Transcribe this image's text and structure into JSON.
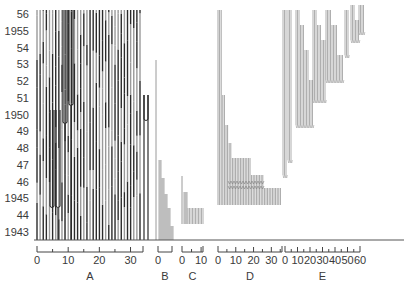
{
  "chart_data": {
    "type": "bar",
    "title": "",
    "xlabel": "",
    "ylabel": "",
    "y_axis": {
      "labels": [
        "56",
        "1955",
        "54",
        "53",
        "52",
        "51",
        "1950",
        "49",
        "48",
        "47",
        "46",
        "1945",
        "44",
        "1943"
      ],
      "years": [
        1956,
        1955,
        1954,
        1953,
        1952,
        1951,
        1950,
        1949,
        1948,
        1947,
        1946,
        1945,
        1944,
        1943
      ],
      "ylim": [
        1943,
        1956
      ]
    },
    "groups": [
      {
        "name": "A",
        "ticks": [
          "0",
          "10",
          "20",
          "30"
        ],
        "tick_values": [
          0,
          10,
          20,
          30
        ],
        "max": 34,
        "lines": 34,
        "start_year": 1943,
        "end_year": 1956
      },
      {
        "name": "B",
        "ticks": [
          "0"
        ],
        "tick_values": [
          0
        ],
        "max": 5,
        "lines": 5,
        "start_year": 1943,
        "end_year": 1947
      },
      {
        "name": "C",
        "ticks": [
          "0",
          "10"
        ],
        "tick_values": [
          0,
          10
        ],
        "max": 11,
        "lines": 11,
        "start_year": 1945,
        "end_year": 1946
      },
      {
        "name": "D",
        "ticks": [
          "0",
          "10",
          "20",
          "30"
        ],
        "tick_values": [
          0,
          10,
          20,
          30
        ],
        "max": 36,
        "lines": 36,
        "start_year": 1945,
        "end_year": 1956
      },
      {
        "name": "E",
        "ticks": [
          "0",
          "10",
          "20",
          "30",
          "40",
          "50",
          "60"
        ],
        "tick_values": [
          0,
          10,
          20,
          30,
          40,
          50,
          60
        ],
        "max": 60,
        "lines": 60,
        "start_year": 1946,
        "end_year": 1956
      }
    ],
    "grid": false,
    "legend": "none"
  },
  "colors": {
    "dark_line": "#2b2b2b",
    "gray_line": "#9a9a9a",
    "light_line": "#c4c4c4",
    "text": "#3a3a3a"
  }
}
